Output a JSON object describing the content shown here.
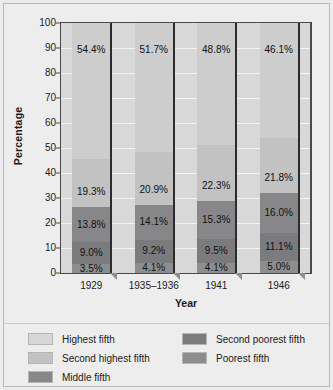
{
  "chart_data": {
    "type": "bar",
    "subtype": "stacked-bar-100",
    "title": "",
    "xlabel": "Year",
    "ylabel": "Percentage",
    "categories": [
      "1929",
      "1935–1936",
      "1941",
      "1946"
    ],
    "ylim": [
      0,
      100
    ],
    "ytick_step": 10,
    "yticks": [
      "100",
      "90",
      "80",
      "70",
      "60",
      "50",
      "40",
      "30",
      "20",
      "10",
      "0"
    ],
    "grid": true,
    "grid_axis": "y",
    "legend_position": "bottom",
    "stack_order_bottom_to_top": [
      "Poorest fifth",
      "Second poorest fifth",
      "Middle fifth",
      "Second highest fifth",
      "Highest fifth"
    ],
    "series": [
      {
        "name": "Poorest fifth",
        "color": "#8d8d8f",
        "values": [
          3.5,
          4.1,
          4.1,
          5.0
        ],
        "labels": [
          "3.5%",
          "4.1%",
          "4.1%",
          "5.0%"
        ]
      },
      {
        "name": "Second poorest fifth",
        "color": "#7b7b7d",
        "values": [
          9.0,
          9.2,
          9.5,
          11.1
        ],
        "labels": [
          "9.0%",
          "9.2%",
          "9.5%",
          "11.1%"
        ]
      },
      {
        "name": "Middle fifth",
        "color": "#878789",
        "values": [
          13.8,
          14.1,
          15.3,
          16.0
        ],
        "labels": [
          "13.8%",
          "14.1%",
          "15.3%",
          "16.0%"
        ]
      },
      {
        "name": "Second highest fifth",
        "color": "#c2c2c3",
        "values": [
          19.3,
          20.9,
          22.3,
          21.8
        ],
        "labels": [
          "19.3%",
          "20.9%",
          "22.3%",
          "21.8%"
        ]
      },
      {
        "name": "Highest fifth",
        "color": "#cdcdce",
        "values": [
          54.4,
          51.7,
          48.8,
          46.1
        ],
        "labels": [
          "54.4%",
          "51.7%",
          "48.8%",
          "46.1%"
        ]
      }
    ],
    "legend": [
      {
        "label": "Highest fifth",
        "color": "#d7d7d8"
      },
      {
        "label": "Second highest fifth",
        "color": "#c2c2c3"
      },
      {
        "label": "Middle fifth",
        "color": "#878789"
      },
      {
        "label": "Second poorest fifth",
        "color": "#7b7b7d"
      },
      {
        "label": "Poorest fifth",
        "color": "#8d8d8f"
      }
    ],
    "legend_columns": {
      "left": [
        "Highest fifth",
        "Second highest fifth",
        "Middle fifth"
      ],
      "right": [
        "Second poorest fifth",
        "Poorest fifth"
      ]
    },
    "colors": {
      "plot_background": "#d8d8d9",
      "figure_background": "#ececed",
      "gridline": "#f2f2f2",
      "axis": "#4a4a4c",
      "text": "#1b1b1b",
      "bar_edge_3d": "#2c2c2e",
      "bar_shadow_3d": "#8e8e90"
    }
  }
}
